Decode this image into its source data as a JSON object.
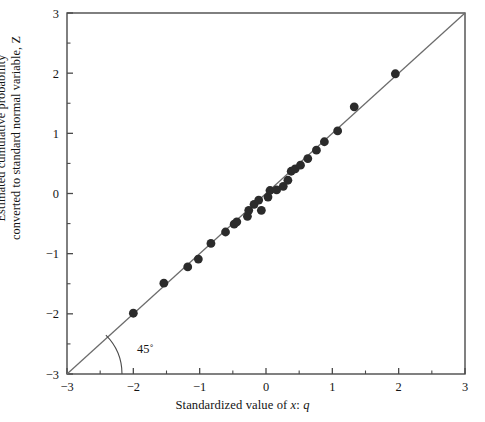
{
  "figure": {
    "title": "",
    "x_axis_label_prefix": "Standardized value of ",
    "x_axis_label_var1": "x",
    "x_axis_label_mid": ": ",
    "x_axis_label_var2": "q",
    "y_axis_label_line1": "Estimated cumulative probability",
    "y_axis_label_line2": "converted to standard normal variable, Z",
    "angle_annotation": "45˚",
    "line_color": "#6b6b6b",
    "marker_color": "#2b2b2b",
    "axis_color": "#4a4a4a",
    "background": "#ffffff"
  },
  "chart_data": {
    "type": "scatter",
    "title": "",
    "xlabel": "Standardized value of x: q",
    "ylabel": "Estimated cumulative probability converted to standard normal variable, Z",
    "xlim": [
      -3,
      3
    ],
    "ylim": [
      -3,
      3
    ],
    "grid": false,
    "legend": null,
    "x_ticks": [
      -3,
      -2,
      -1,
      0,
      1,
      2,
      3
    ],
    "y_ticks": [
      -3,
      -2,
      -1,
      0,
      1,
      2,
      3
    ],
    "x_tick_labels": [
      "−3",
      "−2",
      "−1",
      "0",
      "1",
      "2",
      "3"
    ],
    "y_tick_labels": [
      "−3",
      "−2",
      "−1",
      "0",
      "1",
      "2",
      "3"
    ],
    "x_minor_ticks": [
      -2.5,
      -1.5,
      -0.5,
      0.5,
      1.5,
      2.5
    ],
    "y_minor_ticks": [
      -2.5,
      -1.5,
      -0.5,
      0.5,
      1.5,
      2.5
    ],
    "reference_line": {
      "label": "45˚",
      "slope": 1,
      "intercept": 0,
      "from": [
        -3,
        -3
      ],
      "to": [
        3,
        3
      ]
    },
    "annotations": [
      {
        "text": "45˚",
        "x": -1.82,
        "y": -2.65
      }
    ],
    "series": [
      {
        "name": "Normal probability plot points",
        "marker": "filled-circle",
        "points": [
          [
            -2.0,
            -1.99
          ],
          [
            -1.54,
            -1.49
          ],
          [
            -1.18,
            -1.22
          ],
          [
            -1.02,
            -1.09
          ],
          [
            -0.83,
            -0.83
          ],
          [
            -0.61,
            -0.64
          ],
          [
            -0.48,
            -0.51
          ],
          [
            -0.44,
            -0.47
          ],
          [
            -0.28,
            -0.38
          ],
          [
            -0.26,
            -0.28
          ],
          [
            -0.18,
            -0.18
          ],
          [
            -0.11,
            -0.11
          ],
          [
            -0.07,
            -0.28
          ],
          [
            0.03,
            -0.06
          ],
          [
            0.06,
            0.05
          ],
          [
            0.16,
            0.06
          ],
          [
            0.26,
            0.12
          ],
          [
            0.33,
            0.22
          ],
          [
            0.38,
            0.37
          ],
          [
            0.44,
            0.41
          ],
          [
            0.52,
            0.47
          ],
          [
            0.63,
            0.58
          ],
          [
            0.76,
            0.72
          ],
          [
            0.88,
            0.86
          ],
          [
            1.08,
            1.04
          ],
          [
            1.33,
            1.44
          ],
          [
            1.95,
            1.99
          ]
        ]
      }
    ]
  }
}
